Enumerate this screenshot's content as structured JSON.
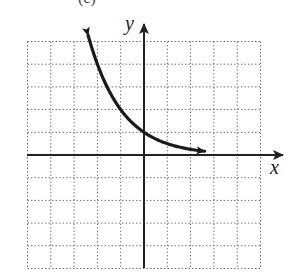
{
  "chart_data": {
    "type": "line",
    "title": "",
    "caption_fragment": "(c)",
    "xlabel": "x",
    "ylabel": "y",
    "xlim": [
      -5,
      5
    ],
    "ylim": [
      -5,
      5
    ],
    "grid": true,
    "grid_style": "dotted",
    "grid_step": 1,
    "tick_labels": false,
    "series": [
      {
        "name": "y = 2^(-x)",
        "function": "y = (1/2)^x",
        "arrow_ends": true,
        "x": [
          -2.4,
          -2,
          -1,
          0,
          1,
          2,
          2.6
        ],
        "y": [
          5.28,
          4,
          2,
          1,
          0.5,
          0.25,
          0.16
        ]
      }
    ],
    "key_points": [
      {
        "x": 0,
        "y": 1,
        "note": "y-intercept"
      },
      {
        "x": -1,
        "y": 2
      },
      {
        "x": -2,
        "y": 4
      },
      {
        "x": 1,
        "y": 0.5
      }
    ],
    "asymptote": {
      "type": "horizontal",
      "y": 0
    }
  },
  "labels": {
    "x_axis": "x",
    "y_axis": "y"
  },
  "colors": {
    "curve": "#1a1a1a",
    "axis": "#222222",
    "grid": "#777777",
    "background": "#ffffff"
  }
}
